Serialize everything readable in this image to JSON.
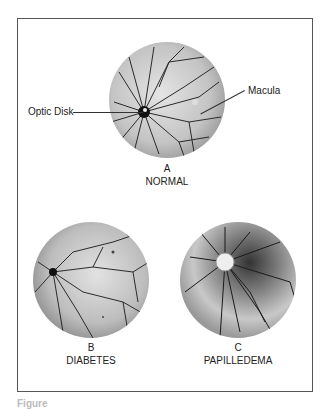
{
  "figure": {
    "panels": [
      {
        "letter": "A",
        "title": "NORMAL"
      },
      {
        "letter": "B",
        "title": "DIABETES"
      },
      {
        "letter": "C",
        "title": "PAPILLEDEMA"
      }
    ],
    "callouts": {
      "optic_disk": "Optic Disk",
      "macula": "Macula"
    },
    "caption": "Figure"
  },
  "colors": {
    "frame": "#555555",
    "fundus_bg": "#c8c8c8",
    "vessel": "#2a2a2a"
  }
}
